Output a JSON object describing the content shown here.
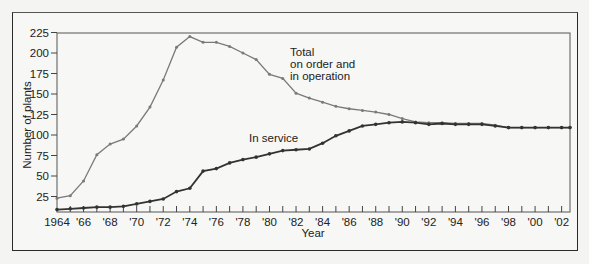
{
  "chart_data": {
    "type": "line",
    "title": "",
    "xlabel": "Year",
    "ylabel": "Number of plants",
    "ylim": [
      6,
      225
    ],
    "xlim": [
      1964,
      2003
    ],
    "grid": false,
    "legend": "none (direct labels)",
    "y_ticks": [
      25,
      50,
      75,
      100,
      125,
      150,
      175,
      200,
      225
    ],
    "x_tick_labels": [
      "1964",
      "'66",
      "'68",
      "'70",
      "'72",
      "'74",
      "'76",
      "'78",
      "'80",
      "'82",
      "'84",
      "'86",
      "'88",
      "'90",
      "'92",
      "'94",
      "'96",
      "'98",
      "'00",
      "'02"
    ],
    "x": [
      1964,
      1965,
      1966,
      1967,
      1968,
      1969,
      1970,
      1971,
      1972,
      1973,
      1974,
      1975,
      1976,
      1977,
      1978,
      1979,
      1980,
      1981,
      1982,
      1983,
      1984,
      1985,
      1986,
      1987,
      1988,
      1989,
      1990,
      1991,
      1992,
      1993,
      1994,
      1995,
      1996,
      1997,
      1998,
      1999,
      2000,
      2001,
      2002,
      2003
    ],
    "series": [
      {
        "name": "Total on order and in operation",
        "color": "#7a7a7a",
        "values": [
          23,
          26,
          44,
          76,
          89,
          95,
          111,
          134,
          167,
          207,
          220,
          213,
          213,
          208,
          200,
          192,
          174,
          169,
          151,
          145,
          140,
          135,
          132,
          130,
          128,
          125,
          120,
          116,
          115,
          115,
          114,
          114,
          114,
          112,
          109,
          109,
          109,
          109,
          109,
          109
        ]
      },
      {
        "name": "In service",
        "color": "#333333",
        "values": [
          9,
          10,
          11,
          12,
          12,
          13,
          16,
          19,
          22,
          31,
          35,
          56,
          59,
          66,
          70,
          73,
          77,
          81,
          82,
          83,
          90,
          99,
          105,
          111,
          113,
          115,
          116,
          115,
          113,
          114,
          113,
          113,
          113,
          111,
          109,
          109,
          109,
          109,
          109,
          109
        ]
      }
    ],
    "annotations": [
      {
        "text": [
          "Total",
          "on order and",
          "in operation"
        ],
        "x": 1981.7,
        "y": 215
      },
      {
        "text": [
          "In service"
        ],
        "x": 1981,
        "y": 107
      }
    ]
  },
  "labels": {
    "ylabel": "Number of plants",
    "xlabel": "Year",
    "annot_total_1": "Total",
    "annot_total_2": "on order and",
    "annot_total_3": "in operation",
    "annot_service": "In service"
  }
}
